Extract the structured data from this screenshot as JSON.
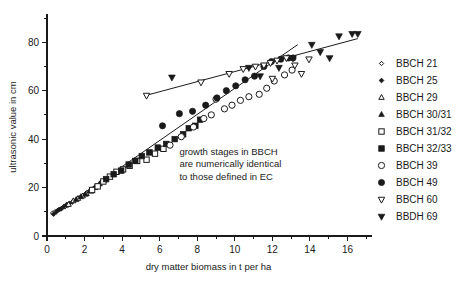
{
  "chart_data": {
    "type": "scatter",
    "title": "",
    "xlabel": "dry matter biomass in t per ha",
    "ylabel": "ultrasonic value in cm",
    "xlim": [
      0,
      17.2
    ],
    "ylim": [
      0,
      90
    ],
    "grid": false,
    "legend_position": "right",
    "x_ticks_major": [
      0,
      2,
      4,
      6,
      8,
      10,
      12,
      14,
      16
    ],
    "x_ticks_major_labels": [
      "0",
      "2",
      "4",
      "6",
      "8",
      "10",
      "12",
      "14",
      "16"
    ],
    "x_ticks_minor": [
      1,
      3,
      5,
      7,
      9,
      11,
      13,
      15,
      17
    ],
    "y_ticks_major": [
      0,
      20,
      40,
      60,
      80
    ],
    "y_ticks_major_labels": [
      "0",
      "20",
      "40",
      "60",
      "80"
    ],
    "y_ticks_minor": [
      10,
      30,
      50,
      70,
      90
    ],
    "annotation": {
      "lines": [
        "growth stages in BBCH",
        "are numerically identical",
        "to those defined in EC"
      ],
      "x": 7.05,
      "y": 33.5
    },
    "trendlines": [
      {
        "name": "upper-regression-line",
        "x": [
          5.25,
          16.55
        ],
        "y": [
          58.0,
          81.5
        ]
      },
      {
        "name": "lower-regression-line",
        "x": [
          0.35,
          13.35
        ],
        "y": [
          9.0,
          79.0
        ]
      }
    ],
    "series": [
      {
        "name": "BBCH 21",
        "marker": "diamond-open",
        "points": [
          [
            0.3,
            9.5
          ],
          [
            0.42,
            10.0
          ],
          [
            0.55,
            10.5
          ],
          [
            0.68,
            11.0
          ],
          [
            0.8,
            11.5
          ],
          [
            0.95,
            12.0
          ],
          [
            1.1,
            12.5
          ]
        ]
      },
      {
        "name": "BBCH 25",
        "marker": "diamond-filled",
        "points": [
          [
            0.35,
            9.0
          ],
          [
            0.5,
            10.0
          ],
          [
            0.62,
            10.8
          ],
          [
            0.75,
            11.2
          ],
          [
            0.9,
            12.2
          ],
          [
            1.05,
            13.0
          ],
          [
            1.2,
            13.5
          ],
          [
            1.35,
            14.0
          ]
        ]
      },
      {
        "name": "BBCH 29",
        "marker": "triangle-up-open",
        "points": [
          [
            1.15,
            13.0
          ],
          [
            1.4,
            14.5
          ],
          [
            1.65,
            15.5
          ],
          [
            1.9,
            16.5
          ],
          [
            2.1,
            17.5
          ],
          [
            2.35,
            18.5
          ]
        ]
      },
      {
        "name": "BBCH 30/31",
        "marker": "triangle-up-filled",
        "points": [
          [
            1.55,
            15.0
          ],
          [
            1.8,
            16.2
          ],
          [
            2.05,
            17.2
          ],
          [
            2.3,
            18.8
          ],
          [
            2.55,
            20.0
          ],
          [
            2.8,
            21.5
          ],
          [
            3.05,
            23.0
          ]
        ]
      },
      {
        "name": "BBCH 31/32",
        "marker": "square-open",
        "points": [
          [
            2.4,
            19.0
          ],
          [
            2.7,
            20.5
          ],
          [
            3.0,
            22.5
          ],
          [
            3.35,
            24.5
          ],
          [
            3.7,
            26.5
          ],
          [
            4.05,
            27.5
          ],
          [
            4.4,
            29.0
          ],
          [
            4.8,
            31.0
          ],
          [
            5.3,
            31.5
          ],
          [
            5.75,
            34.0
          ],
          [
            6.2,
            36.0
          ]
        ]
      },
      {
        "name": "BBCH 32/33",
        "marker": "square-filled",
        "points": [
          [
            3.15,
            23.5
          ],
          [
            3.55,
            25.5
          ],
          [
            3.95,
            27.0
          ],
          [
            4.35,
            29.5
          ],
          [
            4.7,
            31.0
          ],
          [
            5.05,
            33.0
          ],
          [
            5.45,
            34.5
          ],
          [
            5.9,
            36.5
          ],
          [
            6.35,
            38.0
          ],
          [
            6.8,
            40.0
          ],
          [
            7.25,
            42.0
          ],
          [
            7.55,
            44.5
          ],
          [
            7.9,
            45.5
          ],
          [
            8.15,
            48.0
          ]
        ]
      },
      {
        "name": "BBCH 39",
        "marker": "circle-open",
        "points": [
          [
            6.55,
            37.5
          ],
          [
            7.15,
            41.0
          ],
          [
            7.8,
            45.0
          ],
          [
            8.35,
            48.5
          ],
          [
            8.75,
            50.0
          ],
          [
            9.0,
            56.5
          ],
          [
            9.45,
            52.5
          ],
          [
            9.85,
            54.0
          ],
          [
            10.3,
            56.0
          ],
          [
            10.75,
            57.5
          ],
          [
            11.3,
            58.5
          ],
          [
            11.7,
            61.0
          ],
          [
            12.1,
            64.0
          ],
          [
            12.65,
            66.5
          ],
          [
            13.05,
            68.5
          ]
        ]
      },
      {
        "name": "BBCH 49",
        "marker": "circle-filled",
        "points": [
          [
            6.15,
            45.5
          ],
          [
            7.05,
            50.5
          ],
          [
            7.75,
            51.5
          ],
          [
            8.45,
            54.0
          ],
          [
            9.05,
            57.0
          ],
          [
            9.55,
            60.0
          ],
          [
            10.05,
            62.0
          ],
          [
            10.55,
            64.5
          ],
          [
            11.05,
            66.0
          ],
          [
            11.55,
            70.0
          ],
          [
            11.95,
            72.0
          ],
          [
            12.45,
            73.0
          ],
          [
            12.85,
            73.5
          ],
          [
            13.1,
            73.5
          ]
        ]
      },
      {
        "name": "BBCH 60",
        "marker": "triangle-down-open",
        "points": [
          [
            5.3,
            58.0
          ],
          [
            8.2,
            63.5
          ],
          [
            9.7,
            67.0
          ],
          [
            10.45,
            69.0
          ],
          [
            11.1,
            70.0
          ],
          [
            11.55,
            70.5
          ],
          [
            11.9,
            71.5
          ],
          [
            12.25,
            72.5
          ],
          [
            12.75,
            73.5
          ],
          [
            13.2,
            70.5
          ],
          [
            13.55,
            67.0
          ],
          [
            12.0,
            65.0
          ],
          [
            13.95,
            73.0
          ]
        ]
      },
      {
        "name": "BBDH 69",
        "marker": "triangle-down-filled",
        "points": [
          [
            6.65,
            65.5
          ],
          [
            10.75,
            69.5
          ],
          [
            11.35,
            66.0
          ],
          [
            12.35,
            69.5
          ],
          [
            13.1,
            73.5
          ],
          [
            14.1,
            79.0
          ],
          [
            14.55,
            76.0
          ],
          [
            15.55,
            82.5
          ],
          [
            16.25,
            83.5
          ],
          [
            16.55,
            83.5
          ],
          [
            15.05,
            73.5
          ]
        ]
      }
    ]
  },
  "legend": {
    "items": [
      {
        "label": "BBCH 21",
        "marker": "diamond-open"
      },
      {
        "label": "BBCH 25",
        "marker": "diamond-filled"
      },
      {
        "label": "BBCH 29",
        "marker": "triangle-up-open"
      },
      {
        "label": "BBCH 30/31",
        "marker": "triangle-up-filled"
      },
      {
        "label": "BBCH 31/32",
        "marker": "square-open"
      },
      {
        "label": "BBCH 32/33",
        "marker": "square-filled"
      },
      {
        "label": "BBCH 39",
        "marker": "circle-open"
      },
      {
        "label": "BBCH 49",
        "marker": "circle-filled"
      },
      {
        "label": "BBCH 60",
        "marker": "triangle-down-open"
      },
      {
        "label": "BBDH 69",
        "marker": "triangle-down-filled"
      }
    ]
  },
  "colors": {
    "ink": "#1a1a1a",
    "background": "#ffffff"
  }
}
